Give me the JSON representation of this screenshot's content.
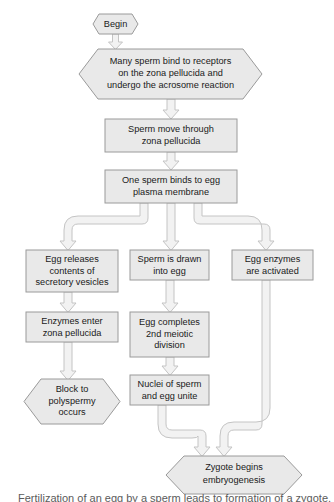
{
  "diagram": {
    "colors": {
      "node_fill": "#e9e9e9",
      "node_stroke": "#9a9a9a",
      "connector_fill": "#f2f2f2",
      "connector_stroke": "#c4c4c4",
      "text": "#1a1a1a",
      "background": "#ffffff"
    },
    "nodes": [
      {
        "id": "begin",
        "shape": "hexagon",
        "x": 93,
        "y": 14,
        "w": 45,
        "h": 20,
        "lines": [
          "Begin"
        ]
      },
      {
        "id": "many-sperm-bind",
        "shape": "hexagon",
        "x": 79,
        "y": 49,
        "w": 183,
        "h": 50,
        "lines": [
          "Many sperm bind to receptors",
          "on the zona pellucida and",
          "undergo the acrosome reaction"
        ]
      },
      {
        "id": "sperm-move-through",
        "shape": "rect",
        "x": 105,
        "y": 119,
        "w": 132,
        "h": 33,
        "lines": [
          "Sperm move through",
          "zona pellucida"
        ]
      },
      {
        "id": "one-sperm-binds",
        "shape": "rect",
        "x": 105,
        "y": 170,
        "w": 132,
        "h": 33,
        "lines": [
          "One sperm binds to egg",
          "plasma membrane"
        ]
      },
      {
        "id": "egg-releases-contents",
        "shape": "rect",
        "x": 26,
        "y": 250,
        "w": 92,
        "h": 42,
        "lines": [
          "Egg releases",
          "contents of",
          "secretory vesicles"
        ]
      },
      {
        "id": "sperm-is-drawn",
        "shape": "rect",
        "x": 130,
        "y": 250,
        "w": 79,
        "h": 30,
        "lines": [
          "Sperm is drawn",
          "into egg"
        ]
      },
      {
        "id": "egg-enzymes-activated",
        "shape": "rect",
        "x": 232,
        "y": 250,
        "w": 81,
        "h": 30,
        "lines": [
          "Egg enzymes",
          "are activated"
        ]
      },
      {
        "id": "enzymes-enter-zona",
        "shape": "rect",
        "x": 26,
        "y": 312,
        "w": 92,
        "h": 30,
        "lines": [
          "Enzymes enter",
          "zona pellucida"
        ]
      },
      {
        "id": "egg-completes-meiotic",
        "shape": "rect",
        "x": 130,
        "y": 312,
        "w": 79,
        "h": 45,
        "lines": [
          "Egg completes",
          "2nd meiotic",
          "division"
        ]
      },
      {
        "id": "block-to-polyspermy",
        "shape": "hexagon",
        "x": 24,
        "y": 379,
        "w": 96,
        "h": 45,
        "lines": [
          "Block to",
          "polyspermy",
          "occurs"
        ]
      },
      {
        "id": "nuclei-unite",
        "shape": "rect",
        "x": 130,
        "y": 375,
        "w": 79,
        "h": 30,
        "lines": [
          "Nuclei of sperm",
          "and egg unite"
        ]
      },
      {
        "id": "zygote-begins",
        "shape": "hexagon",
        "x": 166,
        "y": 456,
        "w": 136,
        "h": 38,
        "lines": [
          "Zygote begins",
          "embryogenesis"
        ]
      }
    ],
    "connectors": [
      {
        "id": "begin-to-many-sperm",
        "kind": "arrow-down",
        "from": "begin",
        "to": "many-sperm-bind"
      },
      {
        "id": "many-sperm-to-sperm-move",
        "kind": "arrow-down",
        "from": "many-sperm-bind",
        "to": "sperm-move-through"
      },
      {
        "id": "sperm-move-to-one-sperm",
        "kind": "arrow-down",
        "from": "sperm-move-through",
        "to": "one-sperm-binds"
      },
      {
        "id": "one-sperm-to-egg-releases",
        "kind": "elbow-left",
        "from": "one-sperm-binds",
        "to": "egg-releases-contents"
      },
      {
        "id": "one-sperm-to-sperm-drawn",
        "kind": "arrow-down",
        "from": "one-sperm-binds",
        "to": "sperm-is-drawn"
      },
      {
        "id": "one-sperm-to-egg-enzymes",
        "kind": "elbow-right",
        "from": "one-sperm-binds",
        "to": "egg-enzymes-activated"
      },
      {
        "id": "egg-releases-to-enzymes-enter",
        "kind": "arrow-down",
        "from": "egg-releases-contents",
        "to": "enzymes-enter-zona"
      },
      {
        "id": "sperm-drawn-to-egg-completes",
        "kind": "arrow-down",
        "from": "sperm-is-drawn",
        "to": "egg-completes-meiotic"
      },
      {
        "id": "enzymes-enter-to-block",
        "kind": "arrow-down",
        "from": "enzymes-enter-zona",
        "to": "block-to-polyspermy"
      },
      {
        "id": "egg-completes-to-nuclei",
        "kind": "arrow-down",
        "from": "egg-completes-meiotic",
        "to": "nuclei-unite"
      },
      {
        "id": "nuclei-to-zygote",
        "kind": "elbow-merge-left",
        "from": "nuclei-unite",
        "to": "zygote-begins"
      },
      {
        "id": "egg-enzymes-to-zygote",
        "kind": "elbow-merge-right",
        "from": "egg-enzymes-activated",
        "to": "zygote-begins"
      }
    ]
  },
  "caption": {
    "text": "Fertilization of an egg by a sperm leads to formation of a zygote."
  }
}
